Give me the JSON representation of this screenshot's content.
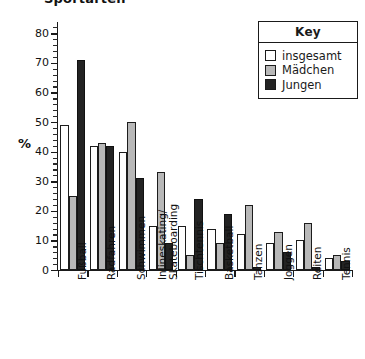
{
  "chart_title": "Sportarten",
  "y_axis_title": "%",
  "y_ticks": [
    0,
    10,
    20,
    30,
    40,
    50,
    60,
    70,
    80
  ],
  "legend": {
    "title": "Key",
    "entries": [
      {
        "label": "insgesamt",
        "color": "#ffffff",
        "key": "insgesamt"
      },
      {
        "label": "Mädchen",
        "color": "#b8b8b8",
        "key": "maedchen"
      },
      {
        "label": "Jungen",
        "color": "#232323",
        "key": "jungen"
      }
    ]
  },
  "chart_data": {
    "type": "bar",
    "title": "Sportarten",
    "xlabel": "",
    "ylabel": "%",
    "ylim": [
      0,
      85
    ],
    "grid": false,
    "legend_position": "top-right",
    "categories": [
      "Fußball",
      "Radfahren",
      "Schwimmen",
      "Inlineskating/\nSkateboarding",
      "Tischtennis",
      "Basketball",
      "Tanzen",
      "Joggen",
      "Reiten",
      "Tennis"
    ],
    "series": [
      {
        "name": "insgesamt",
        "color": "#ffffff",
        "values": [
          49,
          42,
          40,
          15,
          15,
          14,
          12,
          9,
          10,
          4
        ]
      },
      {
        "name": "Mädchen",
        "color": "#b8b8b8",
        "values": [
          25,
          43,
          50,
          33,
          5,
          9,
          22,
          13,
          16,
          5
        ]
      },
      {
        "name": "Jungen",
        "color": "#232323",
        "values": [
          71,
          42,
          31,
          9,
          24,
          19,
          1,
          6,
          1,
          3
        ]
      }
    ]
  }
}
